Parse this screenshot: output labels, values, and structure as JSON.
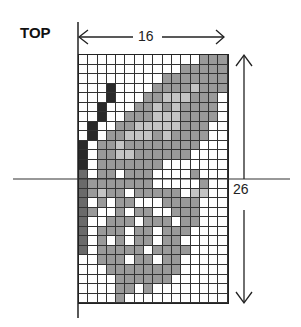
{
  "title": "TOP",
  "dimensions": {
    "width_label": "16",
    "height_label": "26"
  },
  "grid": {
    "columns": 16,
    "rows": 26,
    "legend": {
      ".": "white",
      "g": "gray",
      "l": "light gray",
      "m": "medium dark",
      "d": "black"
    },
    "colors": {
      "white": "#ffffff",
      "gray": "#9a9a9a",
      "light": "#c4c4c4",
      "medium": "#6a6a6a",
      "dark": "#2a2a2a"
    },
    "pattern": [
      ".............ggg",
      "...........ggggg",
      ".........ggggggg",
      "...d....gggglggg",
      "...d...gglllggg.",
      "..d...gglglgggg.",
      "..d..ggglllgggg.",
      ".d..gglllllggg..",
      ".d.gglllglgggg..",
      "d.gglgggggggg...",
      "d.ggllgggggg....",
      "d.ggggggg.......",
      "m.gg.ggg....g...",
      "mggggggg.....g..",
      "mglgg.ggggg.ll..",
      "m.g.gg...gggg...",
      "mg..g.gg..ggg...",
      "m..ggg.ggg.gg...",
      "m.ggg.gg.ggg....",
      "m.g.g.gg.gg.....",
      "m.ggggg.gggg....",
      "..ggg.gg.gg.....",
      "...gggggggg.....",
      "....gggggg......",
      "....gg.g........",
      "....g..........."
    ]
  }
}
